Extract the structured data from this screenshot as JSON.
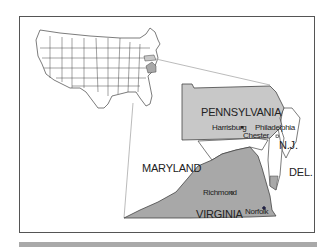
{
  "map": {
    "title": "",
    "highlight_color": "#c8c8c8",
    "dark_fill_color": "#a8a8a8",
    "outline_color": "#444444",
    "states": [
      {
        "name": "PENNSYLVANIA",
        "highlighted": true
      },
      {
        "name": "VIRGINIA",
        "highlighted": true
      },
      {
        "name": "MARYLAND",
        "highlighted": false
      },
      {
        "name": "N.J.",
        "highlighted": false
      },
      {
        "name": "DEL.",
        "highlighted": false
      }
    ],
    "labels": {
      "pennsylvania": "PENNSYLVANIA",
      "maryland": "MARYLAND",
      "virginia": "VIRGINIA",
      "nj": "N.J.",
      "del": "DEL."
    },
    "cities": {
      "harrisburg": "Harrisburg",
      "philadelphia": "Philadelphia",
      "chester": "Chester",
      "richmond": "Richmond",
      "norfolk": "Norfolk"
    }
  }
}
